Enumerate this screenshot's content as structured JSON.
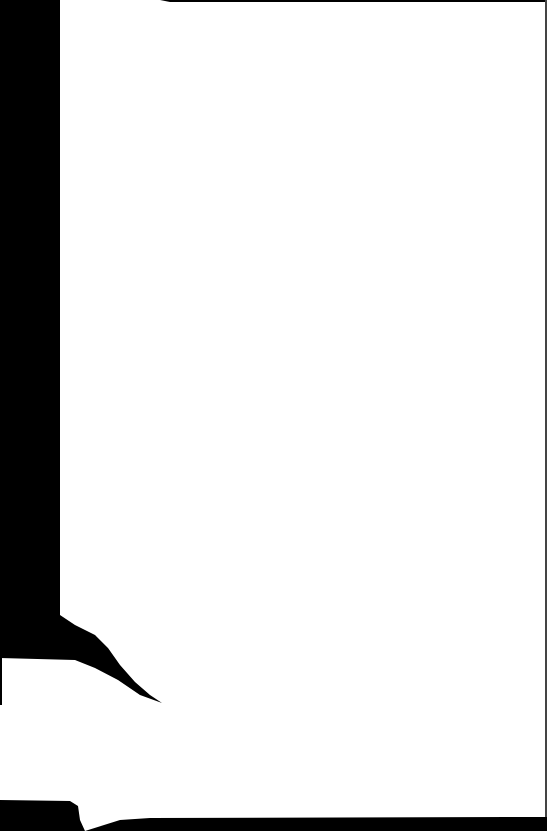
{
  "page": {
    "type": "scanned-blank-page",
    "text_content": "",
    "colors": {
      "paper": "#ffffff",
      "scan_border": "#000000"
    }
  }
}
